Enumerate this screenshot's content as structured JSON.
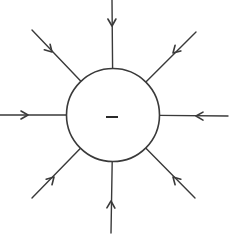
{
  "diagram": {
    "title": "Electric field lines of a negative point charge",
    "charge": {
      "sign": "negative",
      "symbol": "−",
      "sign_icon": "minus-icon"
    },
    "field_lines": {
      "count": 8,
      "direction": "inward",
      "arrowhead_style": "open-chevron",
      "directions_deg": [
        90,
        45,
        0,
        315,
        270,
        225,
        180,
        135
      ],
      "labels": [
        "top",
        "top-right",
        "right",
        "bottom-right",
        "bottom",
        "bottom-left",
        "left",
        "top-left"
      ]
    },
    "colors": {
      "line": "#3a3a3a",
      "background": "#ffffff"
    }
  }
}
